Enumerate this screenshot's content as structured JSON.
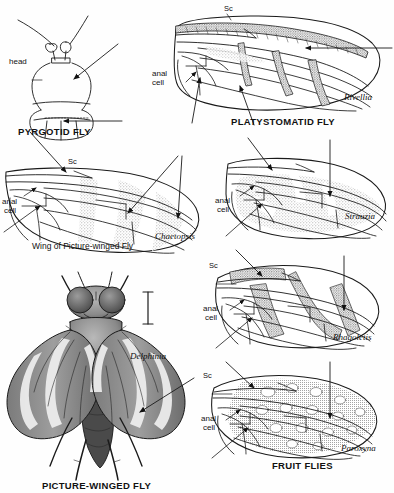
{
  "plate": {
    "title": "Picture-winged Flies and Fruit Flies wing venation plate",
    "background_color": "#fefefe",
    "ink_color": "#1a1a1a",
    "stipple_color": "#8d8d8d"
  },
  "figures": [
    {
      "id": "pyrgotid-head",
      "caption": "PYRGOTID FLY",
      "annotations": [
        "head"
      ],
      "type": "head-diagram"
    },
    {
      "id": "platystomatid-wing",
      "caption": "PLATYSTOMATID FLY",
      "genus": "Rivellia",
      "annotations": [
        "Sc",
        "anal",
        "cell"
      ],
      "type": "wing"
    },
    {
      "id": "picture-winged-wing",
      "caption": "Wing of Picture-winged Fly",
      "genus": "Chaetopsis",
      "annotations": [
        "Sc",
        "anal",
        "cell"
      ],
      "type": "wing"
    },
    {
      "id": "strauzia-wing",
      "genus": "Strauzia",
      "annotations": [
        "anal",
        "cell"
      ],
      "type": "wing"
    },
    {
      "id": "rhagoletis-wing",
      "genus": "Rhagoletis",
      "annotations": [
        "Sc",
        "anal",
        "cell"
      ],
      "type": "wing"
    },
    {
      "id": "paroxyna-wing",
      "caption": "FRUIT FLIES",
      "genus": "Paroxyna",
      "annotations": [
        "Sc",
        "anal",
        "cell"
      ],
      "type": "wing"
    },
    {
      "id": "delphinia-habitus",
      "caption": "PICTURE-WINGED FLY",
      "genus": "Delphinia",
      "type": "whole-fly",
      "scale_bar": true
    }
  ],
  "labels": {
    "head": "head",
    "sc": "Sc",
    "anal": "anal",
    "cell": "cell",
    "pyrgotid_fly": "PYRGOTID FLY",
    "platystomatid_fly": "PLATYSTOMATID FLY",
    "rivellia": "Rivellia",
    "wing_of_picture_winged_fly": "Wing of Picture-winged Fly",
    "chaetopsis": "Chaetopsis",
    "strauzia": "Strauzia",
    "rhagoletis": "Rhagoletis",
    "paroxyna": "Paroxyna",
    "fruit_flies": "FRUIT FLIES",
    "delphinia": "Delphinia",
    "picture_winged_fly": "PICTURE-WINGED FLY"
  }
}
